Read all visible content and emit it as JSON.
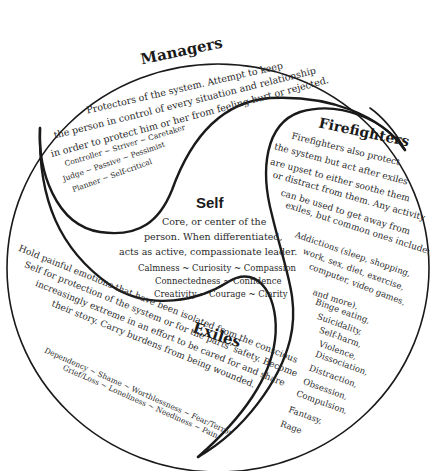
{
  "diagram": {
    "type": "internal-family-systems",
    "colors": {
      "background": "#ffffff",
      "stroke": "#1a1a1a",
      "text": "#2a2a2a"
    },
    "managers": {
      "title": "Managers",
      "description": [
        "Protectors of the system. Attempt to keep",
        "the person in control of every situation and relationship",
        "in order to protect him or her from feeling hurt or rejected."
      ],
      "traits": [
        "Controller ~ Striver ~ Caretaker",
        "Judge ~ Passive ~ Pessimist",
        "Planner ~ Self-critical"
      ]
    },
    "firefighters": {
      "title": "Firefighters",
      "description": [
        "Firefighters also protect",
        "the system but act after exiles",
        "are upset to either soothe them",
        "or distract from them. Any activity",
        "can be used to get away from",
        "exiles, but common ones include:"
      ],
      "examples": [
        "Addictions (sleep, shopping,",
        "work, sex, diet, exercise,",
        "computer, video games,",
        "and more),",
        "Binge eating,",
        "Suicidality,",
        "Self-harm,",
        "Violence,",
        "Dissociation,",
        "Distraction,",
        "Obsession,",
        "Compulsion,",
        "Fantasy,",
        "Rage"
      ]
    },
    "self": {
      "title": "Self",
      "description": [
        "Core, or center of the",
        "person. When differentiated,",
        "acts as active, compassionate leader."
      ],
      "qualities": [
        "Calmness ~ Curiosity ~ Compassion",
        "Connectedness ~ Confidence",
        "Creativity ~ Courage ~ Clarity"
      ]
    },
    "exiles": {
      "title": "Exiles",
      "description": [
        "Hold painful emotions that have been isolated from the conscious",
        "Self for protection of the system or for the parts' safety. Become",
        "increasingly extreme in an effort to be cared for and share",
        "their story. Carry burdens from being wounded."
      ],
      "feelings": [
        "Dependency ~ Shame ~ Worthlessness ~ Fear/Terror",
        "Grief/Loss ~ Loneliness ~ Neediness ~ Pain"
      ]
    }
  }
}
